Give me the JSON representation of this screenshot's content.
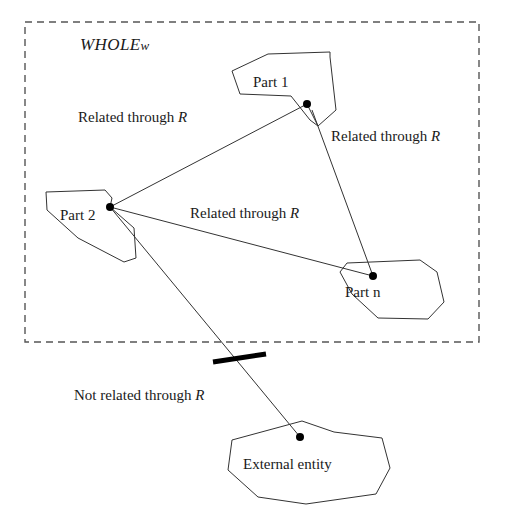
{
  "figure": {
    "type": "diagram",
    "title_label": "WHOLE w",
    "title_main": "WHOLE",
    "title_var": "w",
    "boundary": {
      "name": "whole-boundary",
      "style": "dashed",
      "x": 25,
      "y": 22,
      "width": 454,
      "height": 320
    },
    "nodes": [
      {
        "id": "part-1",
        "label": "Part 1",
        "label_x": 253,
        "label_y": 75,
        "dot_x": 307,
        "dot_y": 104,
        "points": "232,71 268,54 330,52 330,57 336,110 318,126 310,120 291,96 240,94"
      },
      {
        "id": "part-2",
        "label": "Part 2",
        "label_x": 60,
        "label_y": 208,
        "dot_x": 110,
        "dot_y": 207,
        "points": "46,192 105,190 112,198 110,207 134,228 136,258 124,262 78,238 47,210"
      },
      {
        "id": "part-n",
        "label": "Part n",
        "label_x": 345,
        "label_y": 285,
        "dot_x": 373,
        "dot_y": 276,
        "points": "347,263 420,260 437,272 444,302 428,319 378,318 352,294 340,272"
      },
      {
        "id": "external-entity",
        "label": "External entity",
        "label_x": 243,
        "label_y": 457,
        "dot_x": 300,
        "dot_y": 437,
        "points": "302,421 334,432 382,438 390,468 376,494 306,504 258,497 228,470 232,440"
      }
    ],
    "edges": [
      {
        "id": "edge-part2-part1",
        "from": "part-2",
        "to": "part-1",
        "x1": 110,
        "y1": 207,
        "x2": 307,
        "y2": 104,
        "label": "Related through R",
        "label_text": "Related through ",
        "label_var": "R",
        "label_x": 78,
        "label_y": 110,
        "related": true
      },
      {
        "id": "edge-part1-partn",
        "from": "part-1",
        "to": "part-n",
        "x1": 312,
        "y1": 110,
        "x2": 373,
        "y2": 276,
        "label": "Related through R",
        "label_text": "Related through ",
        "label_var": "R",
        "label_x": 331,
        "label_y": 129,
        "related": true
      },
      {
        "id": "edge-part2-partn",
        "from": "part-2",
        "to": "part-n",
        "x1": 110,
        "y1": 207,
        "x2": 373,
        "y2": 276,
        "label": "Related through R",
        "label_text": "Related through ",
        "label_var": "R",
        "label_x": 190,
        "label_y": 206,
        "related": true
      },
      {
        "id": "edge-part2-external",
        "from": "part-2",
        "to": "external-entity",
        "x1": 110,
        "y1": 207,
        "x2": 300,
        "y2": 437,
        "label": "Not related through R",
        "label_text": "Not related through ",
        "label_var": "R",
        "label_x": 74,
        "label_y": 388,
        "related": false,
        "strike": {
          "name": "negation-strike",
          "x1": 213,
          "y1": 362,
          "x2": 266,
          "y2": 354
        }
      }
    ],
    "colors": {
      "stroke": "#333333",
      "boundary": "#555555",
      "text": "#1a1a1a",
      "background": "#ffffff",
      "dot": "#000000"
    }
  }
}
